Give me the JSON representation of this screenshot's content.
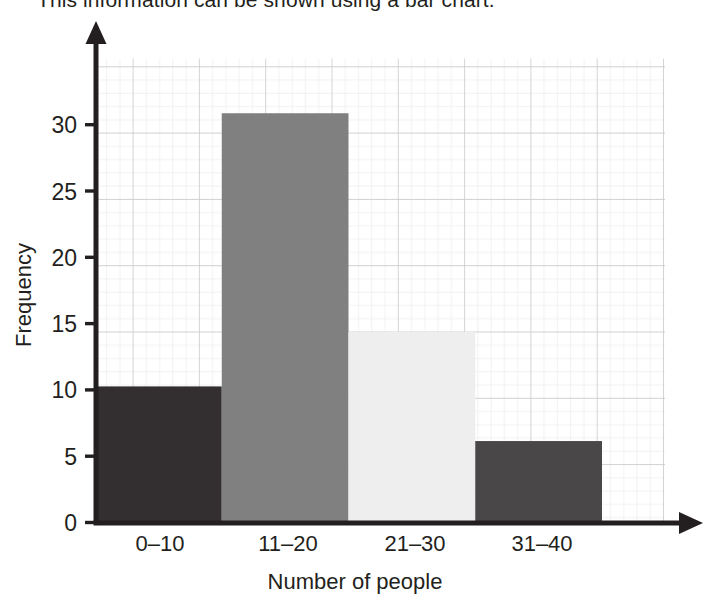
{
  "caption": {
    "text": "This information can be shown using a bar chart."
  },
  "chart_data": {
    "type": "bar",
    "title": "",
    "xlabel": "Number of people",
    "ylabel": "Frequency",
    "categories": [
      "0–10",
      "11–20",
      "21–30",
      "31–40"
    ],
    "values": [
      10,
      30,
      14,
      6
    ],
    "bar_colors": [
      "#332f30",
      "#808080",
      "#eeeeee",
      "#4a4748"
    ],
    "ylim": [
      0,
      34
    ],
    "ytick_values": [
      0,
      5,
      10,
      15,
      20,
      25,
      30
    ],
    "ytick_labels": [
      "0",
      "5",
      "10",
      "15",
      "20",
      "25",
      "30"
    ],
    "grid": true,
    "grid_minor_step": 1,
    "grid_major_step": 5,
    "grid_minor_color": "#e2e2e4",
    "grid_major_color": "#c3c3c6",
    "axis_color": "#231f20",
    "legend": "none",
    "axis_arrows": true
  },
  "axes": {
    "y_axis_name": "frequency-axis",
    "x_axis_name": "number-of-people-axis"
  }
}
